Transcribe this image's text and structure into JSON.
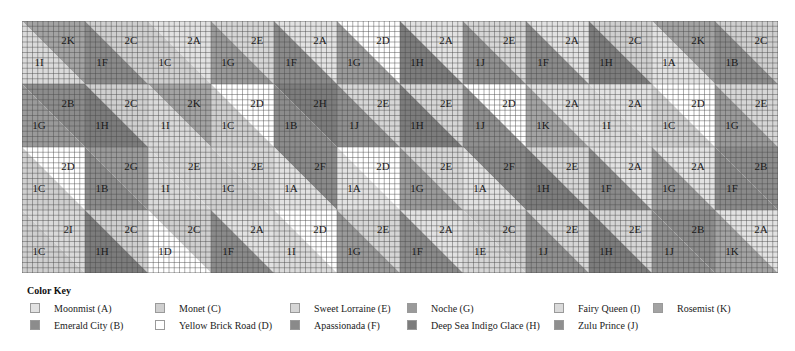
{
  "quilt": {
    "rows": 4,
    "cols": 12,
    "block_size": 63,
    "grid_subdivisions": 12,
    "grid_line_color": "#4a4a4a",
    "blocks": [
      [
        {
          "top": "2K",
          "bottom": "1I"
        },
        {
          "top": "2C",
          "bottom": "1F"
        },
        {
          "top": "2A",
          "bottom": "1C"
        },
        {
          "top": "2E",
          "bottom": "1G"
        },
        {
          "top": "2A",
          "bottom": "1F"
        },
        {
          "top": "2D",
          "bottom": "1G"
        },
        {
          "top": "2A",
          "bottom": "1H"
        },
        {
          "top": "2E",
          "bottom": "1J"
        },
        {
          "top": "2A",
          "bottom": "1F"
        },
        {
          "top": "2C",
          "bottom": "1H"
        },
        {
          "top": "2K",
          "bottom": "1A"
        },
        {
          "top": "2C",
          "bottom": "1B"
        }
      ],
      [
        {
          "top": "2B",
          "bottom": "1G"
        },
        {
          "top": "2C",
          "bottom": "1H"
        },
        {
          "top": "2K",
          "bottom": "1I"
        },
        {
          "top": "2D",
          "bottom": "1C"
        },
        {
          "top": "2H",
          "bottom": "1B"
        },
        {
          "top": "2E",
          "bottom": "1J"
        },
        {
          "top": "2E",
          "bottom": "1H"
        },
        {
          "top": "2D",
          "bottom": "1J"
        },
        {
          "top": "2A",
          "bottom": "1K"
        },
        {
          "top": "2A",
          "bottom": "1I"
        },
        {
          "top": "2D",
          "bottom": "1C"
        },
        {
          "top": "2E",
          "bottom": "1G"
        }
      ],
      [
        {
          "top": "2D",
          "bottom": "1C"
        },
        {
          "top": "2G",
          "bottom": "1B"
        },
        {
          "top": "2E",
          "bottom": "1I"
        },
        {
          "top": "2E",
          "bottom": "1C"
        },
        {
          "top": "2F",
          "bottom": "1A"
        },
        {
          "top": "2D",
          "bottom": "1A"
        },
        {
          "top": "2E",
          "bottom": "1G"
        },
        {
          "top": "2F",
          "bottom": "1A"
        },
        {
          "top": "2E",
          "bottom": "1H"
        },
        {
          "top": "2A",
          "bottom": "1F"
        },
        {
          "top": "2A",
          "bottom": "1G"
        },
        {
          "top": "2B",
          "bottom": "1F"
        }
      ],
      [
        {
          "top": "2I",
          "bottom": "1C"
        },
        {
          "top": "2C",
          "bottom": "1H"
        },
        {
          "top": "2C",
          "bottom": "1D"
        },
        {
          "top": "2A",
          "bottom": "1F"
        },
        {
          "top": "2D",
          "bottom": "1I"
        },
        {
          "top": "2E",
          "bottom": "1G"
        },
        {
          "top": "2A",
          "bottom": "1F"
        },
        {
          "top": "2C",
          "bottom": "1E"
        },
        {
          "top": "2E",
          "bottom": "1J"
        },
        {
          "top": "2E",
          "bottom": "1H"
        },
        {
          "top": "2B",
          "bottom": "1J"
        },
        {
          "top": "2A",
          "bottom": "1K"
        }
      ]
    ]
  },
  "colors": {
    "A": "#e2e2e2",
    "B": "#8c8c8c",
    "C": "#cfcfcf",
    "D": "#ffffff",
    "E": "#d6d6d6",
    "F": "#8a8a8a",
    "G": "#9a9a9a",
    "H": "#7c7c7c",
    "I": "#dadada",
    "J": "#8f8f8f",
    "K": "#a3a3a3"
  },
  "color_key": {
    "title": "Color Key",
    "items": [
      {
        "code": "A",
        "label": "Moonmist (A)"
      },
      {
        "code": "B",
        "label": "Emerald City (B)"
      },
      {
        "code": "C",
        "label": "Monet (C)"
      },
      {
        "code": "D",
        "label": "Yellow Brick Road (D)"
      },
      {
        "code": "E",
        "label": "Sweet Lorraine (E)"
      },
      {
        "code": "F",
        "label": "Apassionada (F)"
      },
      {
        "code": "G",
        "label": "Noche (G)"
      },
      {
        "code": "H",
        "label": "Deep Sea Indigo Glace (H)"
      },
      {
        "code": "I",
        "label": "Fairy Queen (I)"
      },
      {
        "code": "J",
        "label": "Zulu Prince (J)"
      },
      {
        "code": "K",
        "label": "Rosemist (K)"
      }
    ]
  }
}
